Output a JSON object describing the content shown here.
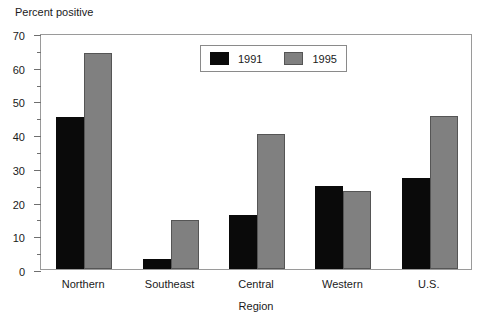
{
  "chart_data": {
    "type": "bar",
    "title": "",
    "xlabel": "Region",
    "ylabel": "Percent positive",
    "categories": [
      "Northern",
      "Southeast",
      "Central",
      "Western",
      "U.S."
    ],
    "series": [
      {
        "name": "1991",
        "color": "#000000",
        "values": [
          45,
          3,
          16,
          24.5,
          27
        ]
      },
      {
        "name": "1995",
        "color": "#808080",
        "values": [
          64,
          14.5,
          40,
          23,
          45.5
        ]
      }
    ],
    "ylim": [
      0,
      70
    ],
    "ytick_major": [
      0,
      10,
      20,
      30,
      40,
      50,
      60,
      70
    ],
    "ytick_minor": [
      5,
      15,
      25,
      35,
      45,
      55,
      65
    ],
    "ytick_labels": [
      "0",
      "10",
      "20",
      "30",
      "40",
      "50",
      "60",
      "70"
    ],
    "grid": false,
    "legend_position": "top-center",
    "legend_entries": [
      "1991",
      "1995"
    ]
  }
}
